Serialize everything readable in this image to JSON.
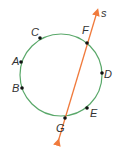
{
  "diagram": {
    "type": "circle-with-secant-line",
    "circle": {
      "cx": 61,
      "cy": 75,
      "r": 41,
      "color": "#5aa86a"
    },
    "line": {
      "label": "s",
      "x1": 58,
      "y1": 142,
      "x2": 97,
      "y2": 12,
      "color": "#f07a3c"
    },
    "points": [
      {
        "name": "C",
        "x": 40,
        "y": 38,
        "lx": 31,
        "ly": 36
      },
      {
        "name": "A",
        "x": 21,
        "y": 62,
        "lx": 12,
        "ly": 65
      },
      {
        "name": "B",
        "x": 22,
        "y": 88,
        "lx": 12,
        "ly": 92
      },
      {
        "name": "F",
        "x": 87,
        "y": 43,
        "lx": 82,
        "ly": 34
      },
      {
        "name": "D",
        "x": 102,
        "y": 73,
        "lx": 104,
        "ly": 78
      },
      {
        "name": "E",
        "x": 87,
        "y": 108,
        "lx": 90,
        "ly": 117
      },
      {
        "name": "G",
        "x": 65,
        "y": 118,
        "lx": 56,
        "ly": 132
      }
    ]
  }
}
